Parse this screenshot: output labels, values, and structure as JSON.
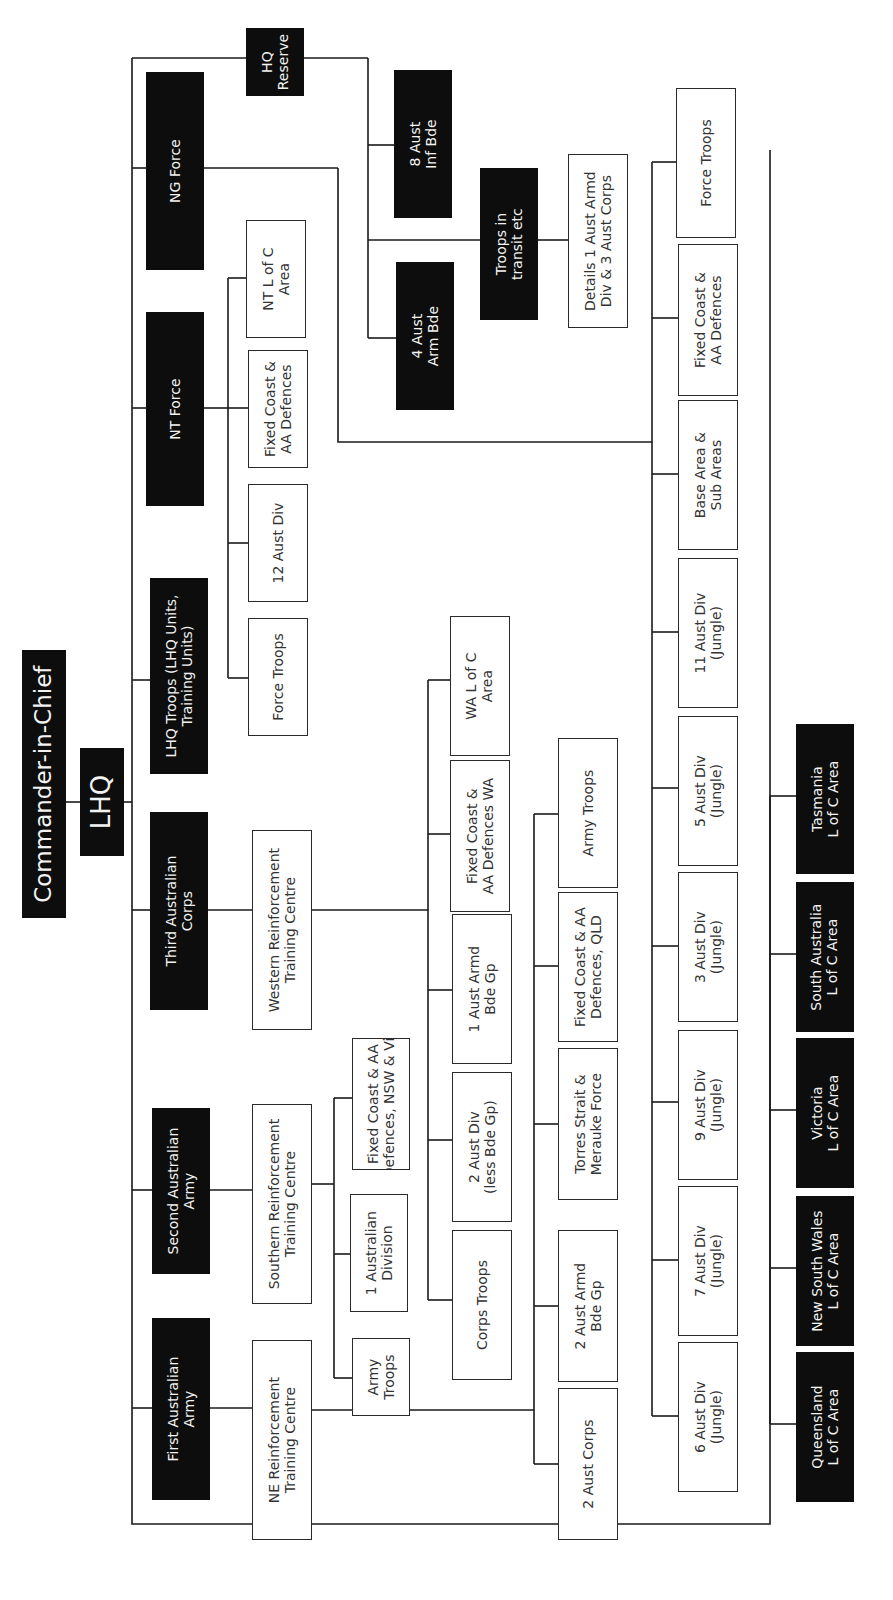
{
  "diagram": {
    "orientation": "rotated 90 degrees counter-clockwise",
    "nodes": [
      {
        "id": "cinc",
        "label": "Commander-in-Chief",
        "style": "dark"
      },
      {
        "id": "lhq",
        "label": "LHQ",
        "style": "dark"
      },
      {
        "id": "first-army",
        "label": "First Australian\nArmy",
        "style": "dark"
      },
      {
        "id": "second-army",
        "label": "Second Australian\nArmy",
        "style": "dark"
      },
      {
        "id": "third-corps",
        "label": "Third Australian\nCorps",
        "style": "dark"
      },
      {
        "id": "lhq-troops",
        "label": "LHQ Troops (LHQ Units,\nTraining Units)",
        "style": "dark"
      },
      {
        "id": "nt-force",
        "label": "NT Force",
        "style": "dark"
      },
      {
        "id": "ng-force",
        "label": "NG Force",
        "style": "dark"
      },
      {
        "id": "hq-reserve",
        "label": "HQ\nReserve",
        "style": "dark"
      },
      {
        "id": "ne-rtc",
        "label": "NE Reinforcement\nTraining Centre",
        "style": "light"
      },
      {
        "id": "s-rtc",
        "label": "Southern Reinforcement\nTraining Centre",
        "style": "light"
      },
      {
        "id": "w-rtc",
        "label": "Western Reinforcement\nTraining Centre",
        "style": "light"
      },
      {
        "id": "army-troops-2",
        "label": "Army\nTroops",
        "style": "light"
      },
      {
        "id": "1-aust-division",
        "label": "1 Australian\nDivision",
        "style": "light"
      },
      {
        "id": "fixed-nsw-vic",
        "label": "Fixed Coast & AA\nDefences, NSW & Vic",
        "style": "light"
      },
      {
        "id": "corps-troops",
        "label": "Corps Troops",
        "style": "light"
      },
      {
        "id": "2-aust-div",
        "label": "2 Aust Div\n(less Bde Gp)",
        "style": "light"
      },
      {
        "id": "1-aust-armd-bde",
        "label": "1 Aust Armd\nBde Gp",
        "style": "light"
      },
      {
        "id": "fixed-wa",
        "label": "Fixed Coast &\nAA Defences WA",
        "style": "light"
      },
      {
        "id": "wa-loc",
        "label": "WA L of C\nArea",
        "style": "light"
      },
      {
        "id": "2-aust-corps",
        "label": "2 Aust Corps",
        "style": "light"
      },
      {
        "id": "2-aust-armd-bde",
        "label": "2 Aust Armd\nBde Gp",
        "style": "light"
      },
      {
        "id": "torres-strait",
        "label": "Torres Strait &\nMerauke Force",
        "style": "light"
      },
      {
        "id": "fixed-qld",
        "label": "Fixed Coast & AA\nDefences, QLD",
        "style": "light"
      },
      {
        "id": "army-troops-1",
        "label": "Army Troops",
        "style": "light"
      },
      {
        "id": "nt-force-troops",
        "label": "Force Troops",
        "style": "light"
      },
      {
        "id": "12-aust-div",
        "label": "12 Aust Div",
        "style": "light"
      },
      {
        "id": "nt-fixed",
        "label": "Fixed Coast &\nAA Defences",
        "style": "light"
      },
      {
        "id": "nt-loc",
        "label": "NT L of C\nArea",
        "style": "light"
      },
      {
        "id": "4-aust-arm-bde",
        "label": "4 Aust\nArm Bde",
        "style": "dark"
      },
      {
        "id": "8-aust-inf-bde",
        "label": "8 Aust\nInf Bde",
        "style": "dark"
      },
      {
        "id": "troops-transit",
        "label": "Troops in\ntransit etc",
        "style": "dark"
      },
      {
        "id": "details-1-armd",
        "label": "Details 1 Aust Armd\nDiv & 3 Aust Corps",
        "style": "light"
      },
      {
        "id": "6-aust-div",
        "label": "6 Aust Div\n(Jungle)",
        "style": "light"
      },
      {
        "id": "7-aust-div",
        "label": "7 Aust Div\n(Jungle)",
        "style": "light"
      },
      {
        "id": "9-aust-div",
        "label": "9 Aust Div\n(Jungle)",
        "style": "light"
      },
      {
        "id": "3-aust-div",
        "label": "3 Aust Div\n(Jungle)",
        "style": "light"
      },
      {
        "id": "5-aust-div",
        "label": "5 Aust Div\n(Jungle)",
        "style": "light"
      },
      {
        "id": "11-aust-div",
        "label": "11 Aust Div\n(Jungle)",
        "style": "light"
      },
      {
        "id": "ng-base-area",
        "label": "Base Area &\nSub Areas",
        "style": "light"
      },
      {
        "id": "ng-fixed",
        "label": "Fixed Coast &\nAA Defences",
        "style": "light"
      },
      {
        "id": "ng-force-troops",
        "label": "Force Troops",
        "style": "light"
      },
      {
        "id": "qld-loc",
        "label": "Queensland\nL of C Area",
        "style": "dark"
      },
      {
        "id": "nsw-loc",
        "label": "New South Wales\nL of C Area",
        "style": "dark"
      },
      {
        "id": "vic-loc",
        "label": "Victoria\nL of C Area",
        "style": "dark"
      },
      {
        "id": "sa-loc",
        "label": "South Australia\nL of C Area",
        "style": "dark"
      },
      {
        "id": "tas-loc",
        "label": "Tasmania\nL of C Area",
        "style": "dark"
      }
    ],
    "edges": [
      [
        "cinc",
        "lhq"
      ],
      [
        "lhq",
        "first-army"
      ],
      [
        "lhq",
        "second-army"
      ],
      [
        "lhq",
        "third-corps"
      ],
      [
        "lhq",
        "lhq-troops"
      ],
      [
        "lhq",
        "nt-force"
      ],
      [
        "lhq",
        "ng-force"
      ],
      [
        "lhq",
        "hq-reserve"
      ],
      [
        "lhq",
        "qld-loc"
      ],
      [
        "lhq",
        "nsw-loc"
      ],
      [
        "lhq",
        "vic-loc"
      ],
      [
        "lhq",
        "sa-loc"
      ],
      [
        "lhq",
        "tas-loc"
      ],
      [
        "first-army",
        "ne-rtc"
      ],
      [
        "ne-rtc",
        "2-aust-corps"
      ],
      [
        "ne-rtc",
        "2-aust-armd-bde"
      ],
      [
        "ne-rtc",
        "torres-strait"
      ],
      [
        "ne-rtc",
        "fixed-qld"
      ],
      [
        "ne-rtc",
        "army-troops-1"
      ],
      [
        "second-army",
        "s-rtc"
      ],
      [
        "s-rtc",
        "army-troops-2"
      ],
      [
        "s-rtc",
        "1-aust-division"
      ],
      [
        "s-rtc",
        "fixed-nsw-vic"
      ],
      [
        "third-corps",
        "w-rtc"
      ],
      [
        "w-rtc",
        "corps-troops"
      ],
      [
        "w-rtc",
        "2-aust-div"
      ],
      [
        "w-rtc",
        "1-aust-armd-bde"
      ],
      [
        "w-rtc",
        "fixed-wa"
      ],
      [
        "w-rtc",
        "wa-loc"
      ],
      [
        "nt-force",
        "nt-force-troops"
      ],
      [
        "nt-force",
        "12-aust-div"
      ],
      [
        "nt-force",
        "nt-fixed"
      ],
      [
        "nt-force",
        "nt-loc"
      ],
      [
        "hq-reserve",
        "4-aust-arm-bde"
      ],
      [
        "hq-reserve",
        "8-aust-inf-bde"
      ],
      [
        "hq-reserve",
        "troops-transit"
      ],
      [
        "troops-transit",
        "details-1-armd"
      ],
      [
        "ng-force",
        "6-aust-div"
      ],
      [
        "ng-force",
        "7-aust-div"
      ],
      [
        "ng-force",
        "9-aust-div"
      ],
      [
        "ng-force",
        "3-aust-div"
      ],
      [
        "ng-force",
        "5-aust-div"
      ],
      [
        "ng-force",
        "11-aust-div"
      ],
      [
        "ng-force",
        "ng-base-area"
      ],
      [
        "ng-force",
        "ng-fixed"
      ],
      [
        "ng-force",
        "ng-force-troops"
      ]
    ]
  },
  "colors": {
    "dark_box": "#0d0d0d",
    "dark_text": "#f2f2f2",
    "light_box": "#ffffff",
    "light_text": "#333333",
    "line": "#1a1a1a"
  }
}
